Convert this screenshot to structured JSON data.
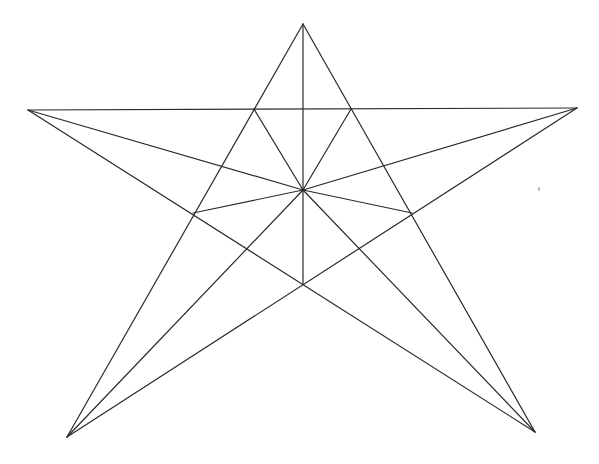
{
  "diagram": {
    "type": "five-pointed-star-construction",
    "stroke_color": "#2a2a2a",
    "background": "#ffffff",
    "points": {
      "top": [
        303,
        24
      ],
      "left": [
        28,
        110
      ],
      "right": [
        577,
        108
      ],
      "bottom_left": [
        67,
        437
      ],
      "bottom_right": [
        535,
        432
      ],
      "center": [
        303,
        190
      ],
      "inner_top_left": [
        254,
        109
      ],
      "inner_top_right": [
        351,
        109
      ],
      "inner_left": [
        193,
        213
      ],
      "inner_right": [
        412,
        213
      ],
      "inner_bottom": [
        303,
        284
      ]
    },
    "lines": [
      [
        "top",
        "bottom_left"
      ],
      [
        "top",
        "bottom_right"
      ],
      [
        "left",
        "right"
      ],
      [
        "left",
        "bottom_right"
      ],
      [
        "right",
        "bottom_left"
      ],
      [
        "top",
        "inner_bottom"
      ],
      [
        "center",
        "left"
      ],
      [
        "center",
        "right"
      ],
      [
        "center",
        "bottom_left"
      ],
      [
        "center",
        "bottom_right"
      ],
      [
        "center",
        "inner_top_left"
      ],
      [
        "center",
        "inner_top_right"
      ],
      [
        "center",
        "inner_left"
      ],
      [
        "center",
        "inner_right"
      ]
    ]
  }
}
